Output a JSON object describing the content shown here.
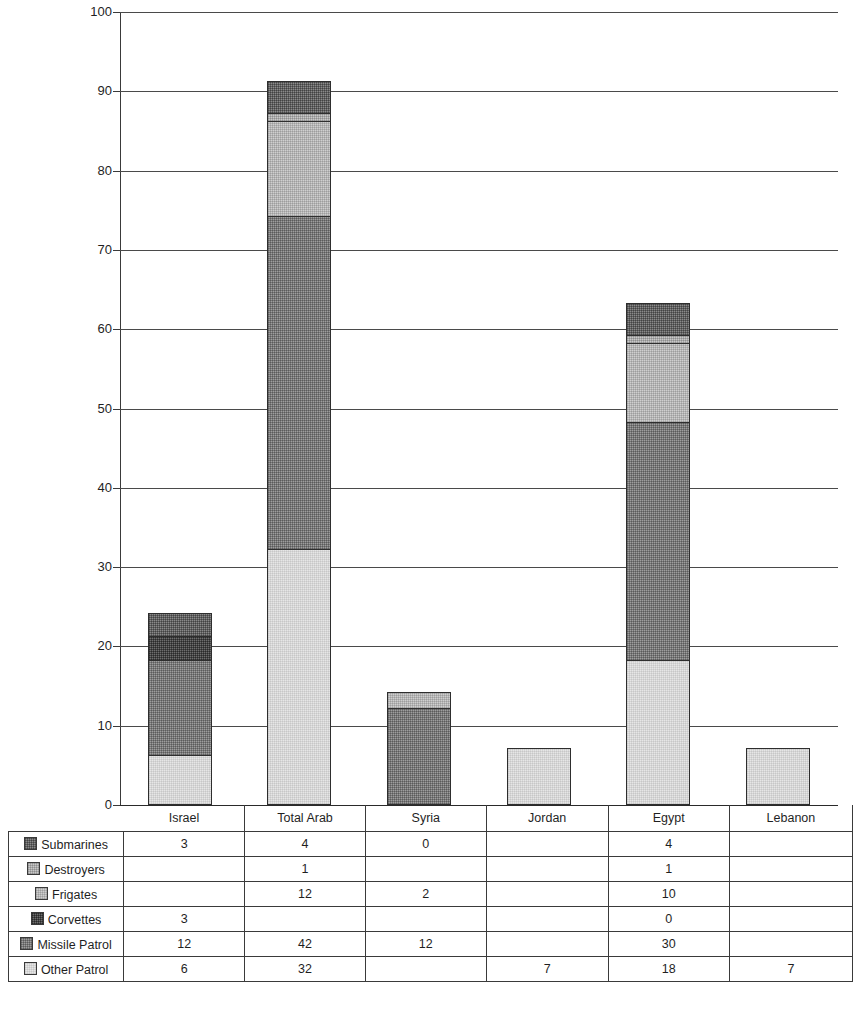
{
  "chart_data": {
    "type": "bar",
    "stacked": true,
    "title": "",
    "xlabel": "",
    "ylabel": "",
    "ylim": [
      0,
      100
    ],
    "ytick_step": 10,
    "yticks": [
      0,
      10,
      20,
      30,
      40,
      50,
      60,
      70,
      80,
      90,
      100
    ],
    "ytick_labels": [
      "0",
      "10",
      "20",
      "30",
      "40",
      "50",
      "60",
      "70",
      "80",
      "90",
      "100"
    ],
    "grid": true,
    "legend_position": "table-row-labels",
    "categories": [
      "Israel",
      "Total Arab",
      "Syria",
      "Jordan",
      "Egypt",
      "Lebanon"
    ],
    "series": [
      {
        "name": "Submarines",
        "key": "sub",
        "color": "#8a8a8a",
        "values": [
          3,
          4,
          0,
          null,
          4,
          null
        ],
        "labels": [
          "3",
          "4",
          "0",
          "",
          "4",
          ""
        ]
      },
      {
        "name": "Destroyers",
        "key": "des",
        "color": "#c9c9c9",
        "values": [
          null,
          1,
          null,
          null,
          1,
          null
        ],
        "labels": [
          "",
          "1",
          "",
          "",
          "1",
          ""
        ]
      },
      {
        "name": "Frigates",
        "key": "fri",
        "color": "#cfcfcf",
        "values": [
          null,
          12,
          2,
          null,
          10,
          null
        ],
        "labels": [
          "",
          "12",
          "2",
          "",
          "10",
          ""
        ]
      },
      {
        "name": "Corvettes",
        "key": "cor",
        "color": "#6e6e6e",
        "values": [
          3,
          null,
          null,
          null,
          0,
          null
        ],
        "labels": [
          "3",
          "",
          "",
          "",
          "0",
          ""
        ]
      },
      {
        "name": "Missile Patrol",
        "key": "mis",
        "color": "#9e9e9e",
        "values": [
          12,
          42,
          12,
          null,
          30,
          null
        ],
        "labels": [
          "12",
          "42",
          "12",
          "",
          "30",
          ""
        ]
      },
      {
        "name": "Other Patrol",
        "key": "oth",
        "color": "#e6e6e6",
        "values": [
          6,
          32,
          null,
          7,
          18,
          7
        ],
        "labels": [
          "6",
          "32",
          "",
          "7",
          "18",
          "7"
        ]
      }
    ],
    "totals": [
      24,
      91,
      14,
      7,
      63,
      7
    ],
    "stack_order_bottom_to_top": [
      "Other Patrol",
      "Missile Patrol",
      "Corvettes",
      "Frigates",
      "Destroyers",
      "Submarines"
    ]
  },
  "table": {
    "corner_label": "",
    "column_headers": [
      "Israel",
      "Total Arab",
      "Syria",
      "Jordan",
      "Egypt",
      "Lebanon"
    ],
    "rows": [
      {
        "label": "Submarines",
        "swatch_class": "f-sub",
        "cells": [
          "3",
          "4",
          "0",
          "",
          "4",
          ""
        ]
      },
      {
        "label": "Destroyers",
        "swatch_class": "f-des",
        "cells": [
          "",
          "1",
          "",
          "",
          "1",
          ""
        ]
      },
      {
        "label": "Frigates",
        "swatch_class": "f-fri",
        "cells": [
          "",
          "12",
          "2",
          "",
          "10",
          ""
        ]
      },
      {
        "label": "Corvettes",
        "swatch_class": "f-cor",
        "cells": [
          "3",
          "",
          "",
          "",
          "0",
          ""
        ]
      },
      {
        "label": "Missile Patrol",
        "swatch_class": "f-mis",
        "cells": [
          "12",
          "42",
          "12",
          "",
          "30",
          ""
        ]
      },
      {
        "label": "Other Patrol",
        "swatch_class": "f-oth",
        "cells": [
          "6",
          "32",
          "",
          "7",
          "18",
          "7"
        ]
      }
    ]
  },
  "footnote": {
    "text": ""
  }
}
